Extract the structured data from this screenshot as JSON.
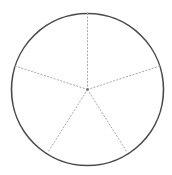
{
  "figure": {
    "background_color": "#ffffff"
  },
  "chart_data": {
    "type": "pie",
    "title": "",
    "subtitle": "",
    "xlabel": "",
    "ylabel": "",
    "legend": [],
    "grid": false,
    "categories": [
      "Sector 1",
      "Sector 2",
      "Sector 3",
      "Sector 4",
      "Sector 5"
    ],
    "values": [
      20,
      20,
      20,
      20,
      20
    ],
    "units": "percent",
    "slice_angle_degrees": 72,
    "slice_count": 5,
    "start_angle_degrees": 90,
    "direction": "clockwise",
    "slice_fill": "none",
    "annotations": []
  },
  "geometry": {
    "center": {
      "x": 87.5,
      "y": 89.5
    },
    "radius": 76,
    "circle": {
      "stroke_color": "#4a4a4a",
      "stroke_width": 1.6,
      "fill": "none",
      "label": "outer circle"
    },
    "spokes": {
      "stroke_color": "#a8a8a8",
      "stroke_width": 1,
      "dash_pattern": "1.2 2.2",
      "linecap": "round",
      "count": 5
    },
    "center_dot": {
      "radius": 1.4,
      "color": "#7a7a7a"
    },
    "radii": [
      {
        "name": "spoke-top",
        "angle_degrees": 90,
        "end_x": 87.5,
        "end_y": 13.5
      },
      {
        "name": "spoke-upper-right",
        "angle_degrees": 18,
        "end_x": 159.8,
        "end_y": 66.0
      },
      {
        "name": "spoke-lower-right",
        "angle_degrees": -54,
        "end_x": 126.2,
        "end_y": 150.9
      },
      {
        "name": "spoke-lower-left",
        "angle_degrees": -126,
        "end_x": 48.8,
        "end_y": 150.9
      },
      {
        "name": "spoke-upper-left",
        "angle_degrees": 162,
        "end_x": 15.2,
        "end_y": 66.0
      }
    ]
  }
}
